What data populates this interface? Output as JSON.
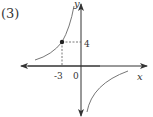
{
  "problem_label": "(3)",
  "axes": {
    "x_label": "x",
    "y_label": "y",
    "origin_label": "0"
  },
  "point": {
    "x": -3,
    "y": 4,
    "x_tick_label": "-3",
    "y_tick_label": "4"
  },
  "curve": {
    "type": "hyperbola",
    "equation": "y = -12/x",
    "branches": [
      "upper-left (x<0)",
      "lower-right (x>0)"
    ]
  },
  "colors": {
    "axis": "#333333",
    "curve": "#555555",
    "dashed": "#555555",
    "point": "#222222"
  }
}
